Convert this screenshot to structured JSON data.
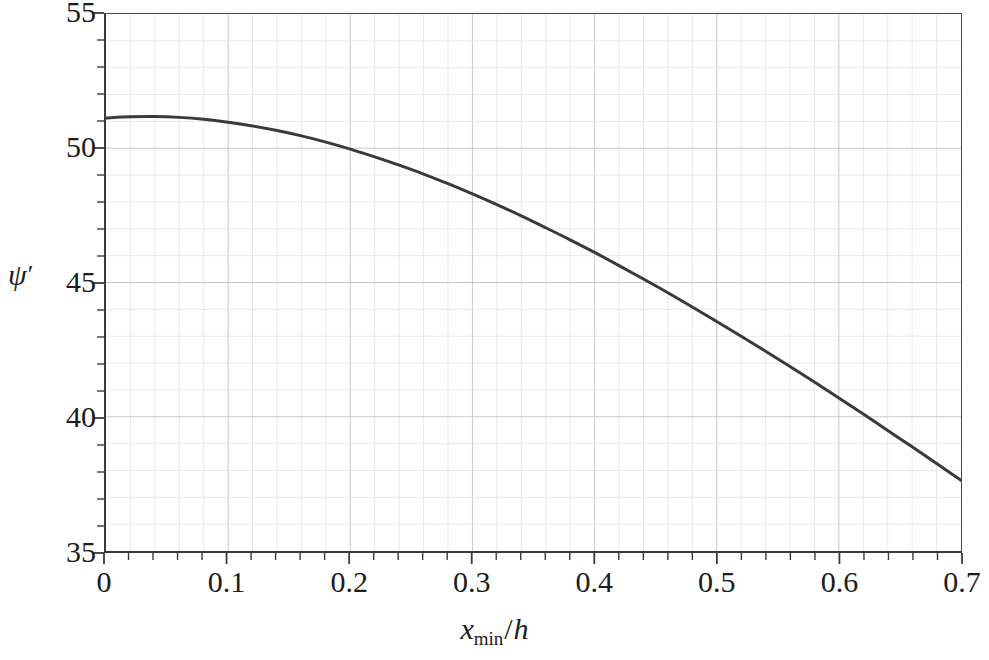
{
  "chart_data": {
    "type": "line",
    "title": "",
    "subtitle": "",
    "xlabel": "x_min/h",
    "ylabel": "psi'",
    "xlabel_parts": {
      "base": "x",
      "subscript": "min",
      "separator": "/",
      "denominator": "h"
    },
    "ylabel_parts": {
      "symbol": "ψ",
      "prime": "′"
    },
    "xlim": [
      0,
      0.7
    ],
    "ylim": [
      35,
      55
    ],
    "x_major_ticks": [
      0,
      0.1,
      0.2,
      0.3,
      0.4,
      0.5,
      0.6,
      0.7
    ],
    "x_tick_labels": [
      "0",
      "0.1",
      "0.2",
      "0.3",
      "0.4",
      "0.5",
      "0.6",
      "0.7"
    ],
    "x_minor_step": 0.02,
    "y_major_ticks": [
      35,
      40,
      45,
      50,
      55
    ],
    "y_tick_labels": [
      "35",
      "40",
      "45",
      "50",
      "55"
    ],
    "y_minor_step": 1,
    "grid": true,
    "grid_minor": true,
    "legend": null,
    "series": [
      {
        "name": "psi-prime-curve",
        "color": "#3a3a3a",
        "line_width": 3,
        "x": [
          0.0,
          0.02,
          0.04,
          0.06,
          0.08,
          0.1,
          0.12,
          0.14,
          0.16,
          0.18,
          0.2,
          0.22,
          0.24,
          0.26,
          0.28,
          0.3,
          0.32,
          0.34,
          0.36,
          0.38,
          0.4,
          0.42,
          0.44,
          0.46,
          0.48,
          0.5,
          0.52,
          0.54,
          0.56,
          0.58,
          0.6,
          0.62,
          0.64,
          0.66,
          0.68,
          0.7
        ],
        "y": [
          51.13,
          51.17,
          51.18,
          51.15,
          51.08,
          50.97,
          50.83,
          50.66,
          50.46,
          50.23,
          49.97,
          49.68,
          49.37,
          49.04,
          48.68,
          48.3,
          47.9,
          47.48,
          47.04,
          46.59,
          46.12,
          45.63,
          45.13,
          44.62,
          44.09,
          43.55,
          43.0,
          42.44,
          41.87,
          41.29,
          40.7,
          40.1,
          39.49,
          38.88,
          38.26,
          37.63
        ]
      }
    ],
    "annotations": []
  },
  "axes": {
    "y_title_symbol": "ψ",
    "y_title_prime": "′",
    "x_title_base": "x",
    "x_title_sub": "min",
    "x_title_slash": "/",
    "x_title_den": "h"
  },
  "colors": {
    "curve": "#3a3a3a",
    "axis": "#3a3a3a",
    "grid_major": "#c9c9c9",
    "grid_minor": "#e2e2e2",
    "text": "#1c1c1c",
    "background": "#ffffff"
  }
}
